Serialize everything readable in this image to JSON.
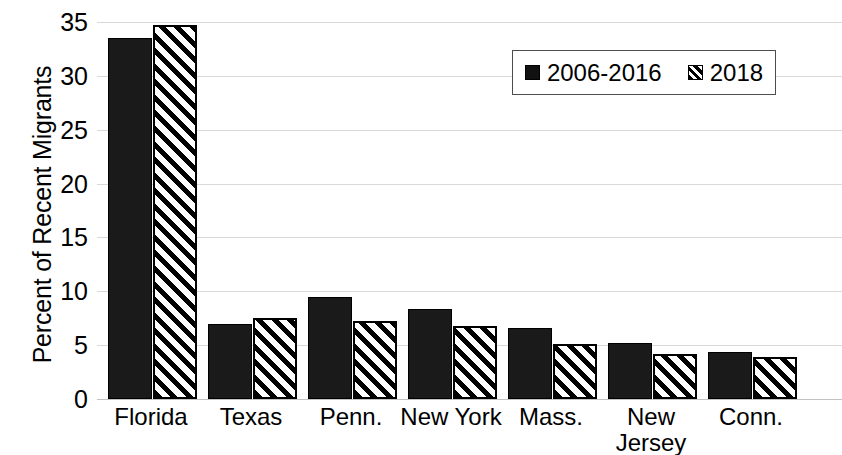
{
  "chart_data": {
    "type": "bar",
    "title": "",
    "xlabel": "",
    "ylabel": "Percent of Recent Migrants",
    "ylim": [
      0,
      35
    ],
    "ytick_step": 5,
    "yticks": [
      35,
      30,
      25,
      20,
      15,
      10,
      5,
      0
    ],
    "grid": true,
    "legend_position": "upper-right",
    "categories": [
      "Florida",
      "Texas",
      "Penn.",
      "New York",
      "Mass.",
      "New Jersey",
      "Conn."
    ],
    "category_lines": [
      [
        "Florida"
      ],
      [
        "Texas"
      ],
      [
        "Penn."
      ],
      [
        "New York"
      ],
      [
        "Mass."
      ],
      [
        "New",
        "Jersey"
      ],
      [
        "Conn."
      ]
    ],
    "series": [
      {
        "name": "2006-2016",
        "style": "solid",
        "color": "#1a1a1a",
        "values": [
          33.5,
          7.0,
          9.5,
          8.4,
          6.6,
          5.2,
          4.4
        ]
      },
      {
        "name": "2018",
        "style": "hatched",
        "color": "#ffffff",
        "values": [
          34.7,
          7.5,
          7.2,
          6.8,
          5.1,
          4.2,
          3.9
        ]
      }
    ]
  },
  "legend": {
    "entries": [
      {
        "label": "2006-2016",
        "swatch": "solid-square-icon"
      },
      {
        "label": "2018",
        "swatch": "hatched-square-icon"
      }
    ]
  },
  "axes": {
    "y_title": "Percent of Recent Migrants"
  }
}
